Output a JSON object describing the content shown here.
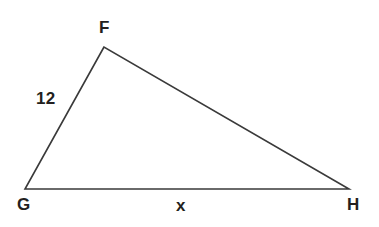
{
  "figure": {
    "kind": "triangle-diagram",
    "shape_name": "triangle-FGH",
    "stroke_color": "#3a3a3a",
    "text_color": "#231f20",
    "background_color": "#ffffff",
    "stroke_width": 1.6,
    "vertices": [
      {
        "name": "F",
        "label": "F",
        "x": 104,
        "y": 47
      },
      {
        "name": "G",
        "label": "G",
        "x": 25,
        "y": 189
      },
      {
        "name": "H",
        "label": "H",
        "x": 349,
        "y": 189
      }
    ],
    "sides": [
      {
        "from": "F",
        "to": "G",
        "label": "12",
        "label_x": 36,
        "label_y": 90
      },
      {
        "from": "G",
        "to": "H",
        "label": "x",
        "label_x": 176,
        "label_y": 197
      },
      {
        "from": "F",
        "to": "H",
        "label": "",
        "label_x": 0,
        "label_y": 0
      }
    ],
    "labels": {
      "vertex_f": "F",
      "vertex_g": "G",
      "vertex_h": "H",
      "side_fg": "12",
      "side_gh": "x"
    }
  }
}
